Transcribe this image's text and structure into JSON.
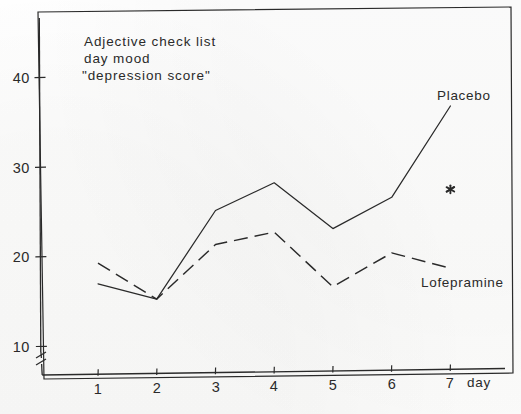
{
  "chart_data": {
    "type": "line",
    "title": "Adjective check list",
    "title_line2": "day mood",
    "title_line3": "\"depression score\"",
    "xlabel": "day",
    "ylabel": "",
    "x": [
      1,
      2,
      3,
      4,
      5,
      6,
      7
    ],
    "categories": [
      "1",
      "2",
      "3",
      "4",
      "5",
      "6",
      "7"
    ],
    "xlim": [
      0.4,
      7.6
    ],
    "ylim": [
      10,
      45
    ],
    "yticks": [
      10,
      20,
      30,
      40
    ],
    "ytick_labels": [
      "10",
      "20",
      "30",
      "40"
    ],
    "xticks": [
      1,
      2,
      3,
      4,
      5,
      6,
      7
    ],
    "grid": false,
    "axis_break": true,
    "legend_position": "inline-right",
    "series": [
      {
        "name": "Placebo",
        "style": "solid",
        "values": [
          17.0,
          15.2,
          25.0,
          28.0,
          22.8,
          26.2,
          36.3
        ]
      },
      {
        "name": "Lofepramine",
        "style": "dashed",
        "values": [
          19.3,
          15.2,
          21.2,
          22.5,
          16.3,
          20.0,
          18.2
        ]
      }
    ],
    "annotations": [
      {
        "name": "significance-asterisk",
        "symbol": "*",
        "x": 7,
        "y": 27.0
      }
    ]
  },
  "labels": {
    "title_l1": "Adjective check list",
    "title_l2": "day mood",
    "title_l3": "\"depression score\"",
    "placebo": "Placebo",
    "lofepramine": "Lofepramine",
    "day": "day",
    "y40": "40",
    "y30": "30",
    "y20": "20",
    "y10": "10",
    "x1": "1",
    "x2": "2",
    "x3": "3",
    "x4": "4",
    "x5": "5",
    "x6": "6",
    "x7": "7",
    "asterisk": "*"
  },
  "colors": {
    "ink": "#2a2a2a",
    "paper": "#fefefe"
  }
}
